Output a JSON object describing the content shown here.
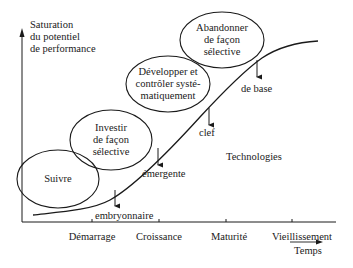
{
  "y_axis": {
    "label_lines": [
      "Saturation",
      "du potentiel",
      "de performance"
    ]
  },
  "x_axis": {
    "label": "Temps",
    "phases": [
      "Démarrage",
      "Croissance",
      "Maturité",
      "Vieillissement"
    ]
  },
  "curve_label": "Technologies",
  "strategies": [
    {
      "lines": [
        "Suivre"
      ]
    },
    {
      "lines": [
        "Investir",
        "de façon",
        "sélective"
      ]
    },
    {
      "lines": [
        "Développer et",
        "contrôler systé-",
        "matiquement"
      ]
    },
    {
      "lines": [
        "Abandonner",
        "de façon",
        "sélective"
      ]
    }
  ],
  "technology_stages": [
    "embryonnaire",
    "émergente",
    "clef",
    "de base"
  ]
}
